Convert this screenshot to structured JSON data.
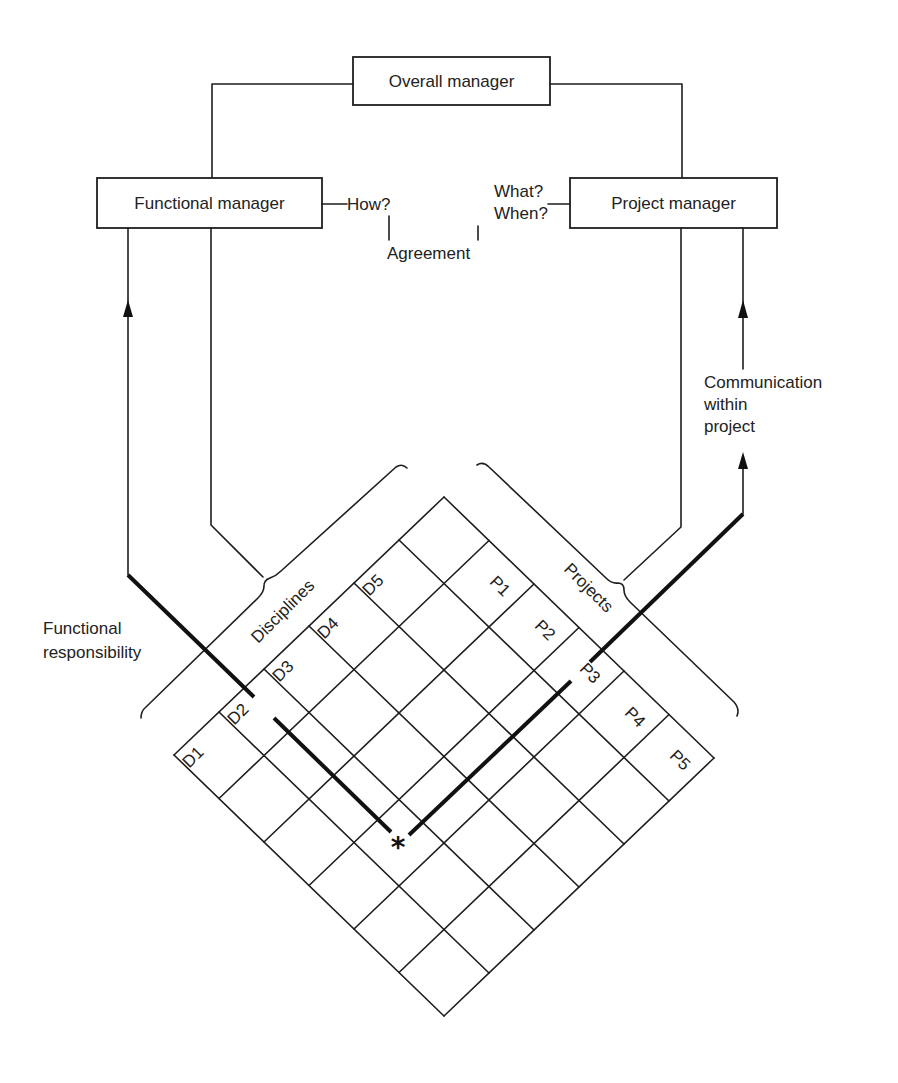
{
  "boxes": {
    "overall_manager": "Overall manager",
    "functional_manager": "Functional manager",
    "project_manager": "Project manager"
  },
  "annotations": {
    "how": "How?",
    "what": "What?",
    "when": "When?",
    "agreement": "Agreement",
    "functional_responsibility": [
      "Functional",
      "responsibility"
    ],
    "communication_within_project": [
      "Communication",
      "within",
      "project"
    ],
    "disciplines": "Disciplines",
    "projects": "Projects",
    "intersection_marker": "*"
  },
  "matrix": {
    "size": 6,
    "disciplines": [
      "D1",
      "D2",
      "D3",
      "D4",
      "D5"
    ],
    "projects": [
      "P1",
      "P2",
      "P3",
      "P4",
      "P5"
    ]
  },
  "colors": {
    "line": "#1e1e1e",
    "background": "#ffffff"
  }
}
